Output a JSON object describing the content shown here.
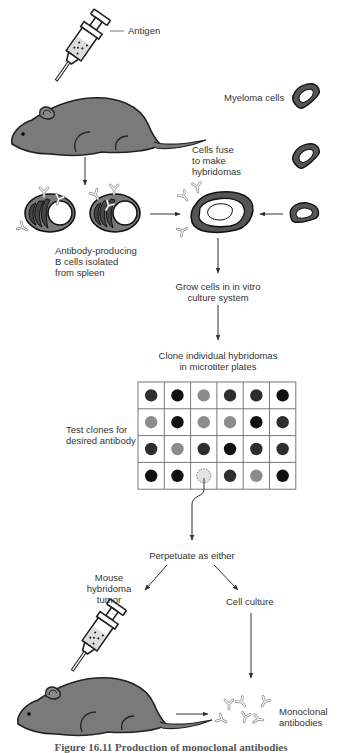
{
  "labels": {
    "antigen": "Antigen",
    "myeloma": "Myeloma cells",
    "fuse": [
      "Cells fuse",
      "to make",
      "hybridomas"
    ],
    "bcells": [
      "Antibody-producing",
      "B cells isolated",
      "from spleen"
    ],
    "grow": [
      "Grow cells in in vitro",
      "culture system"
    ],
    "clone": [
      "Clone individual hybridomas",
      "in microtiter plates"
    ],
    "test": [
      "Test clones for",
      "desired antibody"
    ],
    "perpetuate": "Perpetuate as either",
    "tumor": [
      "Mouse",
      "hybridoma",
      "tumor"
    ],
    "culture": "Cell culture",
    "mono": [
      "Monoclonal",
      "antibodies"
    ]
  },
  "caption": "Figure 16.11 Production of monoclonal antibodies",
  "plate": {
    "rows": 4,
    "cols": 6,
    "wells": [
      [
        "dark",
        "black",
        "gray",
        "dark",
        "dark",
        "black"
      ],
      [
        "gray",
        "black",
        "gray",
        "gray",
        "black",
        "dark"
      ],
      [
        "dark",
        "gray",
        "dark",
        "black",
        "dark",
        "dark"
      ],
      [
        "black",
        "black",
        "selected",
        "dark",
        "gray",
        "black"
      ]
    ],
    "colors": {
      "black": "#111111",
      "dark": "#2e2e2e",
      "gray": "#8c8c8c",
      "selected": "#e4e4e4"
    }
  }
}
